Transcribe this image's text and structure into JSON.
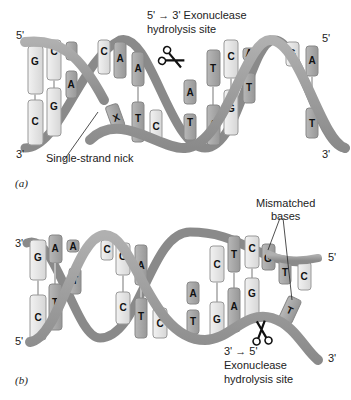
{
  "figure": {
    "panel_a": {
      "label": "(a)",
      "strand_top_end": "5'",
      "strand_bottom_end": "3'",
      "right_top_end": "5'",
      "right_bottom_end": "3'",
      "site_label_line1": "5' → 3' Exonuclease",
      "site_label_line2": "hydrolysis site",
      "nick_label": "Single-strand nick",
      "top_bases": [
        "G",
        "C",
        "T",
        "C",
        "A",
        "A",
        "C",
        "T",
        "C",
        "A",
        "G",
        "A"
      ],
      "bottom_bases": [
        "C",
        "G",
        "A",
        "G",
        "X",
        "T",
        "C",
        "A",
        "T",
        "A",
        "G",
        "T",
        "C",
        "T"
      ],
      "icon": "scissors-icon"
    },
    "panel_b": {
      "label": "(b)",
      "strand_top_end": "3'",
      "strand_bottom_end": "5'",
      "right_top_end": "5'",
      "right_bottom_end": "3'",
      "mismatch_label_line1": "Mismatched",
      "mismatch_label_line2": "bases",
      "site_label_line1": "3' → 5'",
      "site_label_line2": "Exonuclease",
      "site_label_line3": "hydrolysis site",
      "top_bases": [
        "G",
        "A",
        "A",
        "C",
        "G",
        "A",
        "C",
        "T",
        "C",
        "G",
        "T",
        "C"
      ],
      "bottom_bases": [
        "C",
        "T",
        "T",
        "C",
        "T",
        "C",
        "T",
        "G",
        "A",
        "G",
        "T"
      ],
      "icon": "scissors-icon"
    },
    "colors": {
      "backbone": "#9a9a9a",
      "backbone_dark": "#7d7d7d",
      "base_light": "#e4e4e4",
      "base_dark": "#a8a8a8"
    }
  }
}
